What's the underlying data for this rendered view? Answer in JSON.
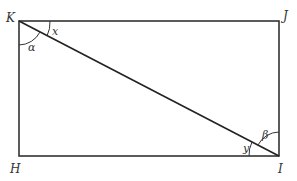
{
  "diagram": {
    "type": "rectangle-with-diagonal",
    "vertices": {
      "K": {
        "label": "K",
        "x": 19,
        "y": 21
      },
      "J": {
        "label": "J",
        "x": 279,
        "y": 21
      },
      "H": {
        "label": "H",
        "x": 19,
        "y": 156
      },
      "I": {
        "label": "I",
        "x": 279,
        "y": 156
      }
    },
    "diagonal": "KI",
    "angles": {
      "alpha": {
        "label": "α",
        "at": "K"
      },
      "x": {
        "label": "x",
        "at": "K"
      },
      "beta": {
        "label": "β",
        "at": "I"
      },
      "y": {
        "label": "y",
        "at": "I"
      }
    },
    "line_color": "#333333"
  }
}
